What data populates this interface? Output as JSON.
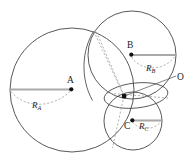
{
  "figure": {
    "type": "geometry-diagram",
    "background_color": "#ffffff",
    "stroke_color": "#3a3a3a",
    "radius_line_color": "#aaaaaa",
    "dash_color": "#9a9a9a",
    "point_color": "#111111",
    "circles": [
      {
        "name": "A",
        "cx": 72,
        "cy": 90,
        "r": 62,
        "center_label": "A",
        "radius_label": "R",
        "radius_subscript": "A"
      },
      {
        "name": "B",
        "cx": 132,
        "cy": 55,
        "r": 44,
        "center_label": "B",
        "radius_label": "R",
        "radius_subscript": "B"
      },
      {
        "name": "C",
        "cx": 133,
        "cy": 121,
        "r": 29,
        "center_label": "C",
        "radius_label": "R",
        "radius_subscript": "C"
      }
    ],
    "points": [
      {
        "name": "intersection",
        "label": "O",
        "x": 124,
        "y": 96
      }
    ],
    "labels": {
      "center_a": "A",
      "center_b": "B",
      "center_c": "C",
      "radius_a": "R",
      "radius_a_sub": "A",
      "radius_b": "R",
      "radius_b_sub": "B",
      "radius_c": "R",
      "radius_c_sub": "C",
      "origin": "O"
    }
  }
}
